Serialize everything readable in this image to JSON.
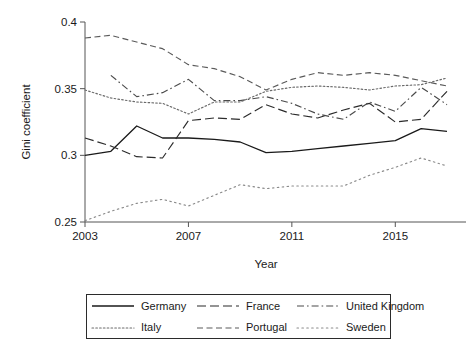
{
  "chart_data": {
    "type": "line",
    "title": "",
    "xlabel": "Year",
    "ylabel": "Gini coefficient",
    "xlim": [
      2003,
      2017
    ],
    "ylim": [
      0.25,
      0.4
    ],
    "xticks": [
      2003,
      2007,
      2011,
      2015
    ],
    "yticks": [
      0.25,
      0.3,
      0.35,
      0.4
    ],
    "ytick_labels": [
      "0.25",
      "0.3",
      "0.35",
      "0.4"
    ],
    "xtick_labels": [
      "2003",
      "2007",
      "2011",
      "2015"
    ],
    "grid": false,
    "legend_position": "below-plot",
    "x": [
      2003,
      2004,
      2005,
      2006,
      2007,
      2008,
      2009,
      2010,
      2011,
      2012,
      2013,
      2014,
      2015,
      2016,
      2017
    ],
    "series": [
      {
        "name": "Germany",
        "style": "solid",
        "color": "#1a1a1a",
        "values": [
          0.3,
          0.303,
          0.322,
          0.313,
          0.313,
          0.312,
          0.31,
          0.302,
          0.303,
          0.305,
          0.307,
          0.309,
          0.311,
          0.32,
          0.318
        ]
      },
      {
        "name": "France",
        "style": "long-dash",
        "color": "#2b2b2b",
        "values": [
          0.313,
          0.307,
          0.299,
          0.298,
          0.326,
          0.328,
          0.327,
          0.338,
          0.331,
          0.328,
          0.334,
          0.339,
          0.325,
          0.327,
          0.348
        ]
      },
      {
        "name": "United Kingdom",
        "style": "dash-dot",
        "color": "#4a4a4a",
        "values": [
          null,
          0.36,
          0.344,
          0.347,
          0.357,
          0.341,
          0.341,
          0.344,
          0.339,
          0.331,
          0.327,
          0.34,
          0.333,
          0.351,
          0.338
        ]
      },
      {
        "name": "Italy",
        "style": "dotted",
        "color": "#6a6a6a",
        "values": [
          0.349,
          0.343,
          0.34,
          0.339,
          0.331,
          0.34,
          0.34,
          0.348,
          0.351,
          0.352,
          0.351,
          0.349,
          0.352,
          0.353,
          0.358
        ]
      },
      {
        "name": "Portugal",
        "style": "dash",
        "color": "#5a5a5a",
        "values": [
          0.388,
          0.39,
          0.385,
          0.38,
          0.368,
          0.365,
          0.359,
          0.349,
          0.357,
          0.362,
          0.36,
          0.362,
          0.36,
          0.356,
          0.352
        ]
      },
      {
        "name": "Sweden",
        "style": "sparse-dot",
        "color": "#8a8a8a",
        "values": [
          0.251,
          0.258,
          0.264,
          0.267,
          0.262,
          0.27,
          0.278,
          0.275,
          0.277,
          0.277,
          0.277,
          0.285,
          0.291,
          0.298,
          0.292
        ]
      }
    ]
  },
  "legend": {
    "items": [
      {
        "label": "Germany",
        "style": "solid"
      },
      {
        "label": "France",
        "style": "long-dash"
      },
      {
        "label": "United Kingdom",
        "style": "dash-dot"
      },
      {
        "label": "Italy",
        "style": "dotted"
      },
      {
        "label": "Portugal",
        "style": "dash"
      },
      {
        "label": "Sweden",
        "style": "sparse-dot"
      }
    ]
  },
  "axes": {
    "y_title": "Gini coefficient",
    "x_title": "Year"
  }
}
